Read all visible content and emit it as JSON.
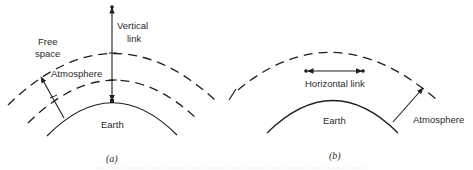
{
  "figure": {
    "panel_a": {
      "caption": "(a)",
      "labels": {
        "free_space_line1": "Free",
        "free_space_line2": "space",
        "vertical_link_line1": "Vertical",
        "vertical_link_line2": "link",
        "atmosphere": "Atmosphere",
        "earth": "Earth"
      }
    },
    "panel_b": {
      "caption": "(b)",
      "labels": {
        "horizontal_link": "Horizontal link",
        "earth": "Earth",
        "atmosphere": "Atmosphere"
      }
    }
  }
}
